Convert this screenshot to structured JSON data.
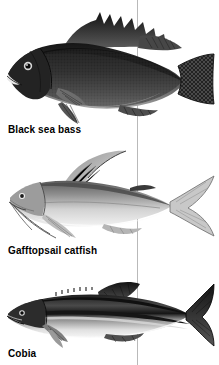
{
  "plate": {
    "background_color": "#ffffff",
    "width": 219,
    "height": 365,
    "divider_line_color": "#b9b9b9"
  },
  "entries": [
    {
      "id": "black-sea-bass",
      "caption": "Black sea bass",
      "illustration": "black-sea-bass-illustration",
      "style": "grayscale scientific engraving",
      "body_color": "#2b2b2b",
      "notes": "deep dark body, spiny dorsal fin with trailing filaments, rounded caudal fin"
    },
    {
      "id": "gafftopsail-catfish",
      "caption": "Gafftopsail catfish",
      "illustration": "gafftopsail-catfish-illustration",
      "style": "grayscale scientific engraving",
      "body_color": "#9a9a9a",
      "notes": "tall sail-like dorsal fin with long filament, chin barbels, deeply forked tail"
    },
    {
      "id": "cobia",
      "caption": "Cobia",
      "illustration": "cobia-illustration",
      "style": "grayscale scientific engraving",
      "body_color": "#3d3d3d",
      "notes": "elongate body, dark lateral stripe, low dorsal spines, forked tail"
    }
  ]
}
